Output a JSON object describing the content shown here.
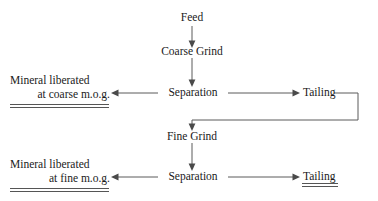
{
  "diagram": {
    "line_color": "#5a5a5a",
    "text_color": "#1a1a1a",
    "nodes": {
      "feed": "Feed",
      "coarse_grind": "Coarse Grind",
      "separation_coarse": "Separation",
      "tailing_coarse": "Tailing",
      "fine_grind": "Fine Grind",
      "separation_fine": "Separation",
      "tailing_fine": "Tailing"
    },
    "products": {
      "coarse_product_line1": "Mineral liberated",
      "coarse_product_line2": "at coarse m.o.g.",
      "fine_product_line1": "Mineral liberated",
      "fine_product_line2": "at fine m.o.g."
    }
  }
}
